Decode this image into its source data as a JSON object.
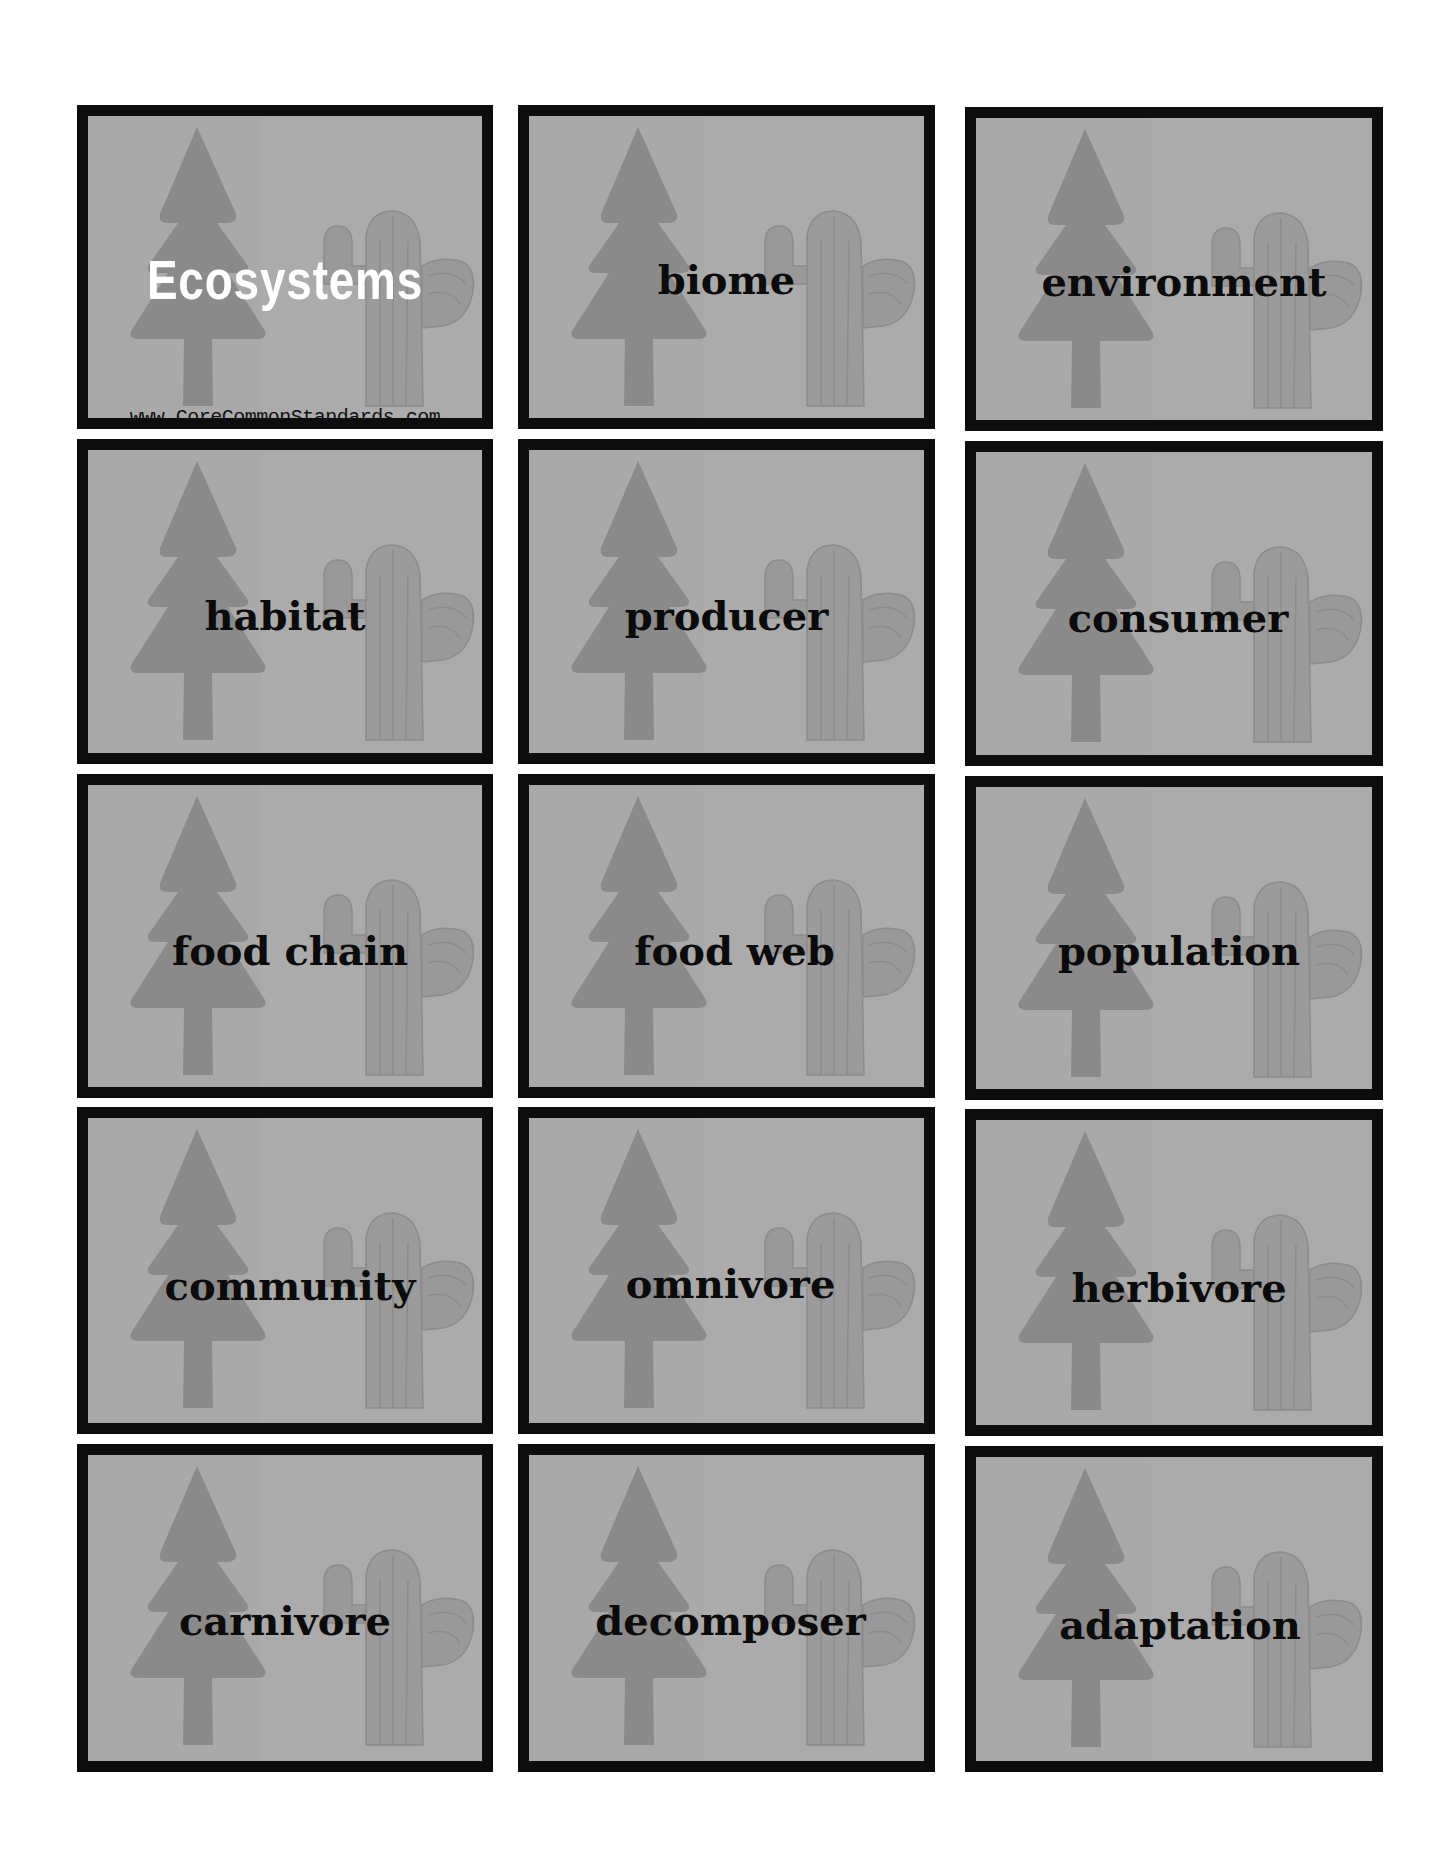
{
  "page": {
    "background": "#ffffff",
    "card_background": "#a9a9a9",
    "card_border": "#0d0d0d",
    "tree_color": "#8a8a8a",
    "cactus_color": "#9b9b9b",
    "cactus_line_color": "#8e8e8e"
  },
  "title_card": {
    "title": "Ecosystems",
    "url": "www.CoreCommonStandards.com",
    "icons": [
      "pine-tree-icon",
      "cactus-icon"
    ]
  },
  "cards": [
    {
      "label": "biome"
    },
    {
      "label": "environment"
    },
    {
      "label": "habitat"
    },
    {
      "label": "producer"
    },
    {
      "label": "consumer"
    },
    {
      "label": "food chain"
    },
    {
      "label": "food web"
    },
    {
      "label": "population"
    },
    {
      "label": "community"
    },
    {
      "label": "omnivore"
    },
    {
      "label": "herbivore"
    },
    {
      "label": "carnivore"
    },
    {
      "label": "decomposer"
    },
    {
      "label": "adaptation"
    }
  ]
}
